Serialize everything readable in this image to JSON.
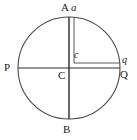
{
  "figure": {
    "kind": "circle-diameters-geometry-diagram",
    "width": 137,
    "height": 140,
    "stroke_color": "#4a4a4a",
    "heavy_stroke_color": "#2b2b2b",
    "label_color": "#1a1a1a",
    "background_color": "#ffffff"
  },
  "geometry": {
    "circle": {
      "cx": 69,
      "cy": 68,
      "r": 51
    },
    "points": {
      "A": {
        "x": 69,
        "y": 17,
        "label": "A"
      },
      "B": {
        "x": 69,
        "y": 119,
        "label": "B"
      },
      "P": {
        "x": 18,
        "y": 68,
        "label": "P"
      },
      "Q": {
        "x": 120,
        "y": 68,
        "label": "Q"
      },
      "C": {
        "x": 69,
        "y": 68,
        "label": "C"
      },
      "a": {
        "x": 74,
        "y": 17,
        "label": "a"
      },
      "q": {
        "x": 120,
        "y": 63,
        "label": "q"
      },
      "c": {
        "x": 74,
        "y": 63,
        "label": "c"
      }
    },
    "segments": [
      {
        "name": "vertical-diameter",
        "from": "A",
        "to": "B"
      },
      {
        "name": "horizontal-diameter",
        "from": "P",
        "to": "Q"
      },
      {
        "name": "chord-a-to-c",
        "from": "a",
        "to": "c"
      },
      {
        "name": "chord-c-to-q",
        "from": "c",
        "to": "q"
      }
    ]
  },
  "labels": {
    "A": "A",
    "a": "a",
    "P": "P",
    "Q": "Q",
    "q": "q",
    "C": "C",
    "B": "B",
    "c": "c"
  }
}
